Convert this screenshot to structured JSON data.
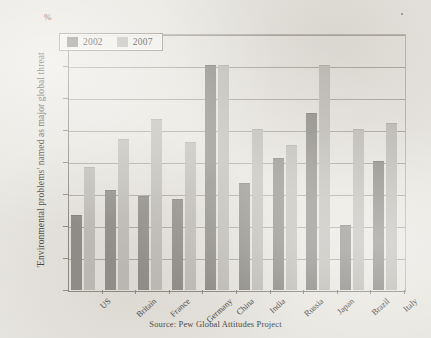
{
  "chart_data": {
    "type": "bar",
    "title": "",
    "subtitle": "",
    "xlabel": "",
    "ylabel": "'Environmental problems' named as major global threat",
    "unit_label": "%",
    "ylim": [
      0,
      80
    ],
    "yticks": [
      0,
      10,
      20,
      30,
      40,
      50,
      60,
      70,
      80
    ],
    "ytick_labels": [
      "0",
      "10",
      "20",
      "30",
      "40",
      "50",
      "60",
      "70",
      "80"
    ],
    "grid": true,
    "legend_position": "top-left",
    "categories": [
      "US",
      "Britain",
      "France",
      "Germany",
      "China",
      "India",
      "Russia",
      "Japan",
      "Brazil",
      "Italy"
    ],
    "series": [
      {
        "name": "2002",
        "color": "#8c8a85",
        "values": [
          23,
          31,
          29,
          28,
          70,
          33,
          41,
          55,
          20,
          40
        ]
      },
      {
        "name": "2007",
        "color": "#bfbdb7",
        "values": [
          38,
          47,
          53,
          46,
          70,
          50,
          45,
          70,
          50,
          52
        ]
      }
    ],
    "source": "Source: Pew Global Attitudes Project"
  },
  "legend": {
    "entries": [
      {
        "label": "2002",
        "swatch": "legend-swatch-2002"
      },
      {
        "label": "2007",
        "swatch": "legend-swatch-2007"
      }
    ]
  },
  "colors": {
    "background": "#e8e6e0",
    "series_2002": "#8c8a85",
    "series_2007": "#bfbdb7",
    "axis": "#8b8881",
    "gridline": "#a9a69f",
    "text": "#45423d"
  }
}
